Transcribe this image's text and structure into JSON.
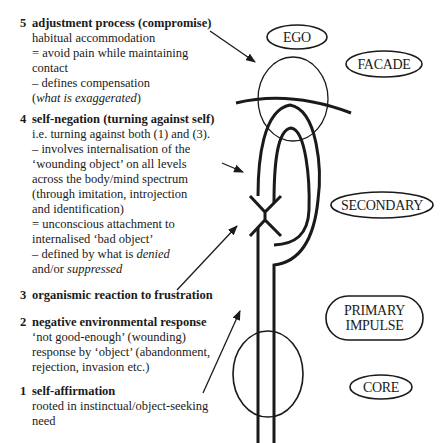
{
  "steps": [
    {
      "number": "5",
      "title": "adjustment process (compromise)",
      "lines": [
        "habitual accommodation",
        "= avoid pain while maintaining",
        "contact",
        "– defines compensation"
      ],
      "italic_line_prefix": "(",
      "italic_line_text": "what is exaggerated",
      "italic_line_suffix": ")"
    },
    {
      "number": "4",
      "title": "self-negation (turning against self)",
      "lines": [
        "i.e. turning against both (1) and (3).",
        "– involves internalisation of the",
        "‘wounding object’ on all levels",
        "across the body/mind spectrum",
        "(through imitation, introjection",
        "and identification)",
        "= unconscious attachment to",
        "internalised ‘bad object’"
      ],
      "defined_prefix": "– defined by what is ",
      "defined_italic": "denied",
      "last_prefix": "and/or ",
      "last_italic": "suppressed"
    },
    {
      "number": "3",
      "title": "organismic reaction to frustration",
      "lines": []
    },
    {
      "number": "2",
      "title": "negative environmental response",
      "lines": [
        "‘not good-enough’ (wounding)",
        "response by ‘object’ (abandonment,",
        "rejection, invasion etc.)"
      ]
    },
    {
      "number": "1",
      "title": "self-affirmation",
      "lines": [
        "rooted in instinctual/object-seeking",
        "need"
      ]
    }
  ],
  "labels": {
    "ego": "EGO",
    "facade": "FACADE",
    "secondary": "SECONDARY",
    "primary_line1": "PRIMARY",
    "primary_line2": "IMPULSE",
    "core": "CORE"
  },
  "colors": {
    "ink": "#1a1a1a",
    "background": "#ffffff"
  }
}
